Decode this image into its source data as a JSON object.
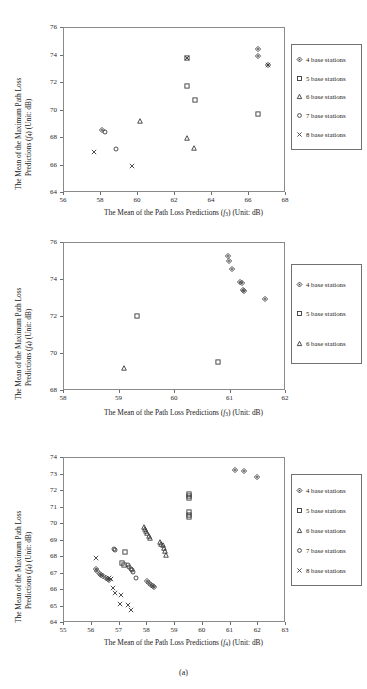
{
  "figure": {
    "caption": "(a)"
  },
  "legend_series": {
    "s4": "4 base stations",
    "s5": "5 base stations",
    "s6": "6 base stations",
    "s7": "7 base stations",
    "s8": "8 base stations"
  },
  "chart_data": [
    {
      "id": "panel-1",
      "type": "scatter",
      "title": "",
      "xlabel": "The Mean of the Path Loss Predictions (f3) (Unit: dB)",
      "ylabel": "The Mean of the Maximum Path Loss Predictions (f4) (Unit: dB)",
      "xlim": [
        56,
        68
      ],
      "ylim": [
        64,
        76
      ],
      "xticks": [
        56,
        58,
        60,
        62,
        64,
        66,
        68
      ],
      "yticks": [
        64,
        66,
        68,
        70,
        72,
        74,
        76
      ],
      "grid": false,
      "legend_position": "right",
      "legend": [
        "4 base stations",
        "5 base stations",
        "6 base stations",
        "7 base stations",
        "8 base stations"
      ],
      "series": [
        {
          "name": "4 base stations",
          "marker": "diamond",
          "points": [
            [
              66.5,
              74.5
            ],
            [
              66.5,
              73.95
            ],
            [
              67.0,
              73.3
            ],
            [
              58.05,
              68.55
            ]
          ]
        },
        {
          "name": "5 base stations",
          "marker": "square",
          "points": [
            [
              62.65,
              73.85
            ],
            [
              62.65,
              71.8
            ],
            [
              63.1,
              70.8
            ],
            [
              66.5,
              69.75
            ]
          ]
        },
        {
          "name": "6 base stations",
          "marker": "triangle",
          "points": [
            [
              60.1,
              69.25
            ],
            [
              62.65,
              68.0
            ],
            [
              63.05,
              67.25
            ]
          ]
        },
        {
          "name": "7 base stations",
          "marker": "circle",
          "points": [
            [
              58.2,
              68.45
            ],
            [
              58.8,
              67.2
            ]
          ]
        },
        {
          "name": "8 base stations",
          "marker": "cross",
          "points": [
            [
              57.6,
              67.0
            ],
            [
              59.65,
              65.95
            ],
            [
              67.0,
              73.3
            ],
            [
              62.65,
              73.85
            ]
          ]
        }
      ]
    },
    {
      "id": "panel-2",
      "type": "scatter",
      "title": "",
      "xlabel": "The Mean of the Path Loss Predictions (f3) (Unit: dB)",
      "ylabel": "The Mean of the Maximum Path Loss Predictions (f4) (Unit: dB)",
      "xlim": [
        58,
        62
      ],
      "ylim": [
        68,
        76
      ],
      "xticks": [
        58,
        59,
        60,
        61,
        62
      ],
      "yticks": [
        68,
        70,
        72,
        74,
        76
      ],
      "grid": false,
      "legend_position": "right",
      "legend": [
        "4 base stations",
        "5 base stations",
        "6 base stations"
      ],
      "series": [
        {
          "name": "4 base stations",
          "marker": "diamond",
          "points": [
            [
              60.95,
              75.3
            ],
            [
              60.97,
              75.05
            ],
            [
              61.03,
              74.6
            ],
            [
              61.17,
              73.9
            ],
            [
              61.2,
              73.85
            ],
            [
              61.22,
              73.45
            ],
            [
              61.25,
              73.4
            ],
            [
              61.63,
              73.0
            ]
          ]
        },
        {
          "name": "5 base stations",
          "marker": "square",
          "points": [
            [
              59.32,
              72.05
            ],
            [
              60.78,
              69.55
            ]
          ]
        },
        {
          "name": "6 base stations",
          "marker": "triangle",
          "points": [
            [
              59.08,
              69.25
            ]
          ]
        }
      ]
    },
    {
      "id": "panel-3",
      "type": "scatter",
      "title": "",
      "xlabel": "The Mean of the Path Loss Predictions (f4) (Unit: dB)",
      "ylabel": "The Mean of the Maximum Path Loss Predictions (f4) (Unit: dB)",
      "xlim": [
        55,
        63
      ],
      "ylim": [
        64,
        74
      ],
      "xticks": [
        55,
        56,
        57,
        58,
        59,
        60,
        61,
        62,
        63
      ],
      "yticks": [
        64,
        65,
        66,
        67,
        68,
        69,
        70,
        71,
        72,
        73,
        74
      ],
      "grid": false,
      "legend_position": "right",
      "legend": [
        "4 base stations",
        "5 base stations",
        "6 base stations",
        "7 base stations",
        "8 base stations"
      ],
      "series": [
        {
          "name": "4 base stations",
          "marker": "diamond",
          "points": [
            [
              61.15,
              73.25
            ],
            [
              61.5,
              73.2
            ],
            [
              61.95,
              72.85
            ],
            [
              56.15,
              67.25
            ],
            [
              56.2,
              67.15
            ],
            [
              56.28,
              67.0
            ],
            [
              56.35,
              66.9
            ],
            [
              56.42,
              66.82
            ],
            [
              56.5,
              66.75
            ],
            [
              56.58,
              66.68
            ],
            [
              56.62,
              66.62
            ],
            [
              58.0,
              66.55
            ],
            [
              58.05,
              66.45
            ],
            [
              58.12,
              66.3
            ],
            [
              58.2,
              66.22
            ],
            [
              58.25,
              66.18
            ]
          ]
        },
        {
          "name": "5 base stations",
          "marker": "square",
          "points": [
            [
              59.5,
              71.8
            ],
            [
              59.5,
              71.7
            ],
            [
              59.52,
              71.6
            ],
            [
              59.5,
              70.7
            ],
            [
              59.5,
              70.55
            ],
            [
              59.52,
              70.45
            ],
            [
              57.2,
              68.3
            ],
            [
              57.1,
              67.65
            ],
            [
              57.15,
              67.5
            ]
          ]
        },
        {
          "name": "6 base stations",
          "marker": "triangle",
          "points": [
            [
              57.9,
              69.8
            ],
            [
              57.93,
              69.7
            ],
            [
              57.97,
              69.6
            ],
            [
              58.0,
              69.45
            ],
            [
              58.05,
              69.3
            ],
            [
              58.1,
              69.15
            ],
            [
              58.45,
              68.9
            ],
            [
              58.5,
              68.8
            ],
            [
              58.55,
              68.7
            ],
            [
              58.6,
              68.55
            ],
            [
              58.65,
              68.35
            ],
            [
              58.68,
              68.15
            ]
          ]
        },
        {
          "name": "7 base stations",
          "marker": "circle",
          "points": [
            [
              56.8,
              68.5
            ],
            [
              56.85,
              68.4
            ],
            [
              57.3,
              67.5
            ],
            [
              57.35,
              67.4
            ],
            [
              57.4,
              67.3
            ],
            [
              57.45,
              67.2
            ],
            [
              57.5,
              67.1
            ],
            [
              57.6,
              66.7
            ]
          ]
        },
        {
          "name": "8 base stations",
          "marker": "cross",
          "points": [
            [
              56.15,
              67.95
            ],
            [
              56.62,
              66.75
            ],
            [
              56.7,
              66.65
            ],
            [
              56.78,
              66.1
            ],
            [
              56.82,
              65.8
            ],
            [
              57.05,
              65.7
            ],
            [
              57.02,
              65.15
            ],
            [
              57.3,
              65.1
            ],
            [
              57.4,
              64.8
            ]
          ]
        }
      ]
    }
  ]
}
